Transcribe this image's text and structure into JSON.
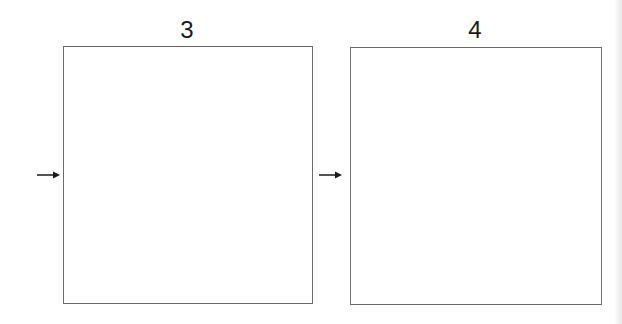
{
  "diagram": {
    "panels": [
      {
        "label": "3",
        "arrow_icon": "right-arrow-icon"
      },
      {
        "label": "4",
        "arrow_icon": "right-arrow-icon"
      }
    ],
    "colors": {
      "border": "#6b6b6b",
      "text": "#1a1a1a",
      "arrow": "#1a1a1a"
    }
  }
}
